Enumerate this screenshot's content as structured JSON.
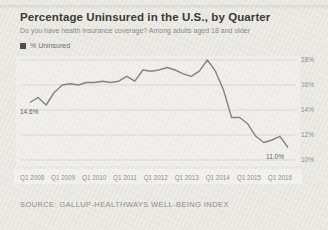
{
  "header": {
    "title": "Percentage Uninsured in the U.S., by Quarter",
    "subtitle": "Do you have health insurance coverage? Among adults aged 18 and older"
  },
  "legend": {
    "label": "% Uninsured",
    "marker_color": "#4f4f4f"
  },
  "chart_data": {
    "type": "line",
    "series_name": "% Uninsured",
    "x": [
      "Q1 2008",
      "Q2 2008",
      "Q3 2008",
      "Q4 2008",
      "Q1 2009",
      "Q2 2009",
      "Q3 2009",
      "Q4 2009",
      "Q1 2010",
      "Q2 2010",
      "Q3 2010",
      "Q4 2010",
      "Q1 2011",
      "Q2 2011",
      "Q3 2011",
      "Q4 2011",
      "Q1 2012",
      "Q2 2012",
      "Q3 2012",
      "Q4 2012",
      "Q1 2013",
      "Q2 2013",
      "Q3 2013",
      "Q4 2013",
      "Q1 2014",
      "Q2 2014",
      "Q3 2014",
      "Q4 2014",
      "Q1 2015",
      "Q2 2015",
      "Q3 2015",
      "Q4 2015",
      "Q1 2016"
    ],
    "values": [
      14.6,
      15.0,
      14.4,
      15.4,
      16.0,
      16.1,
      16.0,
      16.2,
      16.2,
      16.3,
      16.2,
      16.3,
      16.7,
      16.3,
      17.2,
      17.1,
      17.2,
      17.4,
      17.2,
      16.9,
      16.7,
      17.1,
      18.0,
      17.1,
      15.6,
      13.4,
      13.4,
      12.9,
      11.9,
      11.4,
      11.6,
      11.9,
      11.0
    ],
    "ylim": [
      10,
      18
    ],
    "yticks": [
      {
        "value": 18,
        "label": "18%"
      },
      {
        "value": 16,
        "label": "16%"
      },
      {
        "value": 14,
        "label": "14%"
      },
      {
        "value": 12,
        "label": "12%"
      },
      {
        "value": 10,
        "label": "10%"
      }
    ],
    "xticks": [
      "Q1 2008",
      "Q1 2009",
      "Q1 2010",
      "Q1 2011",
      "Q1 2012",
      "Q1 2013",
      "Q1 2014",
      "Q1 2015",
      "Q1 2016"
    ],
    "annotations": [
      {
        "index": 0,
        "label": "14.6%"
      },
      {
        "index": 32,
        "label": "11.0%"
      }
    ],
    "line_color": "#85837f",
    "grid": true,
    "legend_position": "top-left",
    "y_axis_side": "right"
  },
  "source": {
    "text": "SOURCE: GALLUP-HEALTHWAYS WELL-BEING INDEX"
  }
}
